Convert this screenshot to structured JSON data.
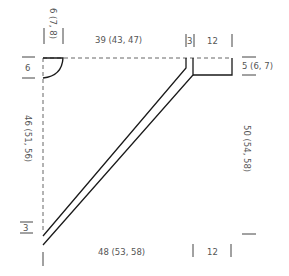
{
  "diagram": {
    "type": "knitting-schematic",
    "colors": {
      "outline": "#1a1a1a",
      "dashed": "#666666",
      "label": "#555555",
      "tick": "#444444"
    },
    "labels": {
      "neck_depth": "6",
      "neck_width": "6 (7, 8)",
      "top_width": "39 (43, 47)",
      "strap_width": "3",
      "shoulder_width_top": "12",
      "shoulder_height": "5 (6, 7)",
      "left_height": "46 (51, 56)",
      "right_height": "50 (54, 58)",
      "bottom_strap": "3",
      "bottom_width": "48 (53, 58)",
      "bottom_right_width": "12"
    }
  }
}
